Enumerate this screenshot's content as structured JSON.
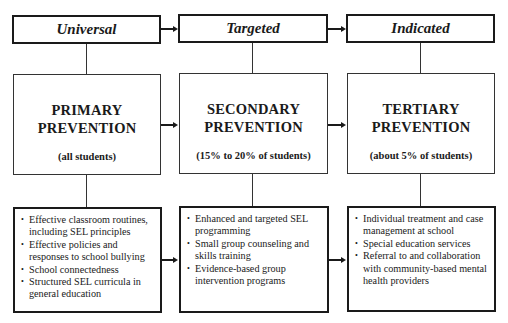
{
  "tiers": [
    {
      "header": "Universal",
      "title_line1": "PRIMARY",
      "title_line2": "PREVENTION",
      "population": "(all students)",
      "items": [
        "Effective classroom routines, including SEL principles",
        "Effective policies and responses to school bullying",
        "School connectedness",
        "Structured SEL curricula in general education"
      ]
    },
    {
      "header": "Targeted",
      "title_line1": "SECONDARY",
      "title_line2": "PREVENTION",
      "population": "(15% to 20% of students)",
      "items": [
        "Enhanced and targeted SEL programming",
        "Small group counseling and skills training",
        "Evidence-based group intervention programs"
      ]
    },
    {
      "header": "Indicated",
      "title_line1": "TERTIARY",
      "title_line2": "PREVENTION",
      "population": "(about 5% of students)",
      "items": [
        "Individual treatment and case management at school",
        "Special education services",
        "Referral to and collaboration with community-based mental health providers"
      ]
    }
  ]
}
